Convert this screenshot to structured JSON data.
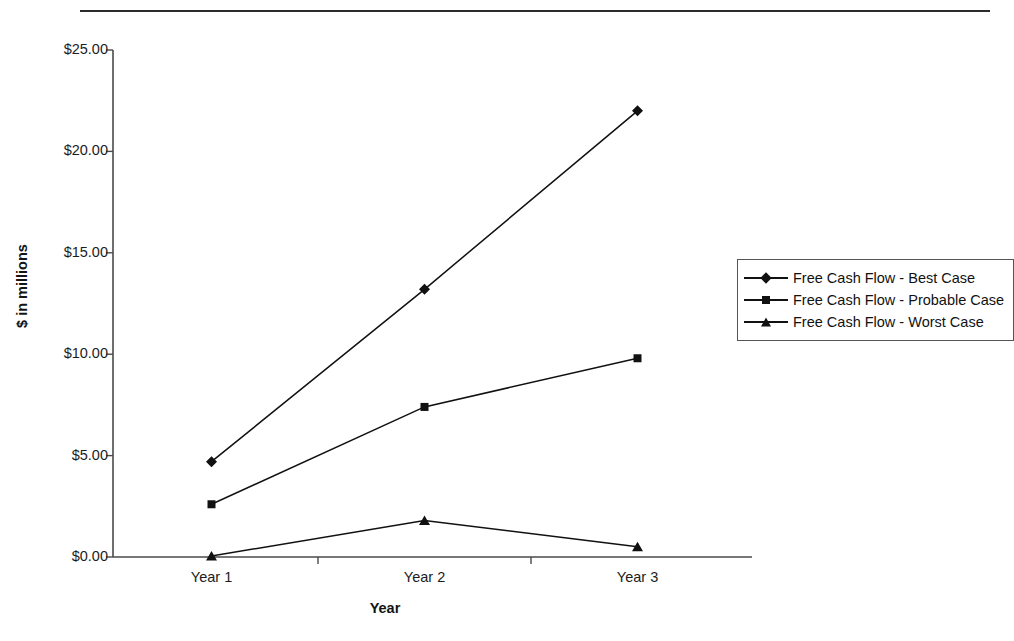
{
  "chart_data": {
    "type": "line",
    "title": "",
    "xlabel": "Year",
    "ylabel": "$ in millions",
    "categories": [
      "Year 1",
      "Year 2",
      "Year 3"
    ],
    "ylim": [
      0,
      25
    ],
    "ytick_labels": [
      "$0.00",
      "$5.00",
      "$10.00",
      "$15.00",
      "$20.00",
      "$25.00"
    ],
    "ytick_values": [
      0,
      5,
      10,
      15,
      20,
      25
    ],
    "grid": false,
    "legend_position": "right",
    "series": [
      {
        "name": "Free Cash Flow - Best Case",
        "marker": "diamond",
        "color": "#111111",
        "values": [
          4.7,
          13.2,
          22.0
        ]
      },
      {
        "name": "Free Cash Flow - Probable Case",
        "marker": "square",
        "color": "#111111",
        "values": [
          2.6,
          7.4,
          9.8
        ]
      },
      {
        "name": "Free Cash Flow - Worst Case",
        "marker": "triangle",
        "color": "#111111",
        "values": [
          0.05,
          1.8,
          0.5
        ]
      }
    ]
  },
  "legend": {
    "items": [
      {
        "label": "Free Cash Flow - Best Case",
        "marker": "diamond"
      },
      {
        "label": "Free Cash Flow - Probable Case",
        "marker": "square"
      },
      {
        "label": "Free Cash Flow - Worst Case",
        "marker": "triangle"
      }
    ]
  },
  "axes": {
    "x_title": "Year",
    "y_title": "$ in millions"
  }
}
